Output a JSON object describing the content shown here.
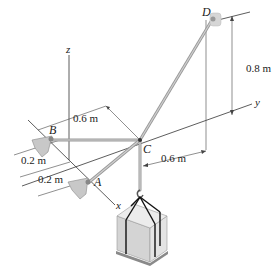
{
  "figure": {
    "points": {
      "A": "A",
      "B": "B",
      "C": "C",
      "D": "D"
    },
    "axes": {
      "x": "x",
      "y": "y",
      "z": "z"
    },
    "dimensions": {
      "D_height": "0.8 m",
      "B_to_C": "0.6 m",
      "C_to_D_horizontal": "0.6 m",
      "B_offset": "0.2 m",
      "A_offset": "0.2 m"
    },
    "colors": {
      "rod": "#a9a9a9",
      "line": "#333333",
      "support": "#bdbdbd",
      "crate": "#d9d9d9",
      "strap": "#111111"
    },
    "elements": [
      "cable CA",
      "cable CB",
      "cable CD",
      "hook",
      "crate on pallet",
      "wall support D",
      "ball supports A and B"
    ]
  }
}
